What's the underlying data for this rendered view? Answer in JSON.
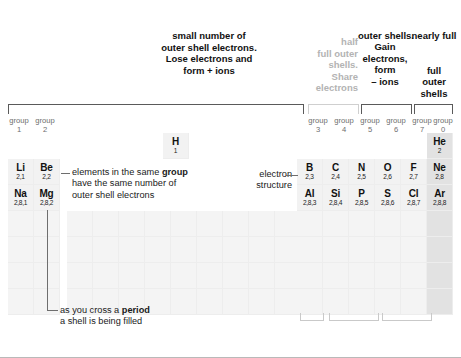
{
  "annotations": {
    "left_caption": [
      "small number of",
      "outer shell electrons.",
      "Lose electrons and",
      "form + ions"
    ],
    "gray_caption": [
      "half",
      "full outer",
      "shells.",
      "Share",
      "electrons"
    ],
    "mid_caption": [
      "",
      "outer shells.",
      "Gain",
      "electrons,",
      "form",
      "– ions"
    ],
    "right_caption": [
      "nearly full",
      "",
      "",
      "full",
      "outer",
      "shells"
    ],
    "electron_structure_label": [
      "electron",
      "structure"
    ],
    "group_note": [
      "elements in the same ",
      "group",
      "have the same number of",
      "outer shell electrons"
    ],
    "group_note_line1_a": "elements in the same ",
    "group_note_line1_b": "group",
    "group_note_line2": "have the same number of",
    "group_note_line3": "outer shell electrons",
    "period_note_line1_a": "as you cross a ",
    "period_note_line1_b": "period",
    "period_note_line2": "a shell is being filled"
  },
  "groups": {
    "left": [
      {
        "word": "group",
        "num": "1"
      },
      {
        "word": "group",
        "num": "2"
      }
    ],
    "right": [
      {
        "word": "group",
        "num": "3"
      },
      {
        "word": "group",
        "num": "4"
      },
      {
        "word": "group",
        "num": "5"
      },
      {
        "word": "group",
        "num": "6"
      },
      {
        "word": "group",
        "num": "7"
      },
      {
        "word": "group",
        "num": "0"
      }
    ]
  },
  "elements": {
    "hydrogen": {
      "symbol": "H",
      "structure": "1"
    },
    "helium": {
      "symbol": "He",
      "structure": "2"
    },
    "left_row1": [
      {
        "symbol": "Li",
        "structure": "2,1"
      },
      {
        "symbol": "Be",
        "structure": "2,2"
      }
    ],
    "left_row2": [
      {
        "symbol": "Na",
        "structure": "2,8,1"
      },
      {
        "symbol": "Mg",
        "structure": "2,8,2"
      }
    ],
    "right_row1": [
      {
        "symbol": "B",
        "structure": "2,3"
      },
      {
        "symbol": "C",
        "structure": "2,4"
      },
      {
        "symbol": "N",
        "structure": "2,5"
      },
      {
        "symbol": "O",
        "structure": "2,6"
      },
      {
        "symbol": "F",
        "structure": "2,7"
      },
      {
        "symbol": "Ne",
        "structure": "2,8"
      }
    ],
    "right_row2": [
      {
        "symbol": "Al",
        "structure": "2,8,3"
      },
      {
        "symbol": "Si",
        "structure": "2,8,4"
      },
      {
        "symbol": "P",
        "structure": "2,8,5"
      },
      {
        "symbol": "S",
        "structure": "2,8,6"
      },
      {
        "symbol": "Cl",
        "structure": "2,8,7"
      },
      {
        "symbol": "Ar",
        "structure": "2,8,8"
      }
    ]
  },
  "colors": {
    "cell_fill": "#f4f4f4",
    "noble_fill": "#e2e2e2",
    "bracket": "#5a5a5a",
    "bracket_light": "#cfcfcf",
    "gray_text": "#b3b3b3",
    "text": "#111111"
  }
}
